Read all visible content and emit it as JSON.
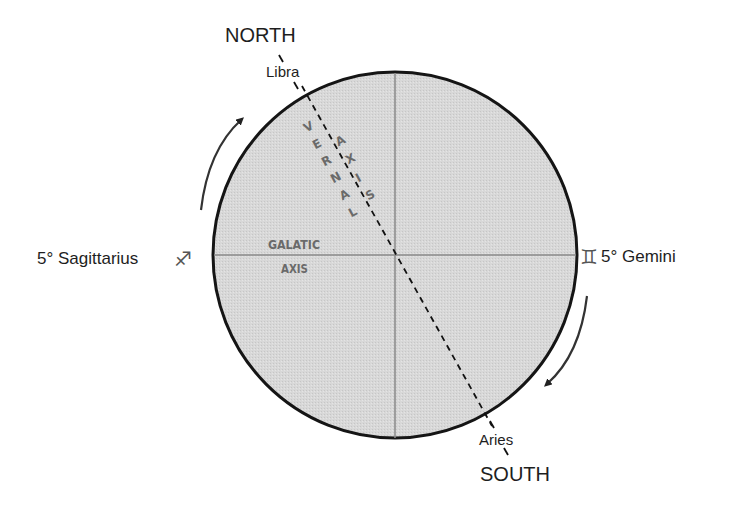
{
  "diagram": {
    "north_label": "NORTH",
    "south_label": "SOUTH",
    "top_point_label": "Libra",
    "bottom_point_label": "Aries",
    "left_label": "5° Sagittarius",
    "right_label": "5° Gemini",
    "left_symbol": "♐",
    "right_symbol": "♊",
    "galactic_axis_line1": "GALATIC",
    "galactic_axis_line2": "AXIS",
    "vernal_letters": [
      "V",
      "E",
      "R",
      "N",
      "A",
      "L"
    ],
    "axis_letters": [
      "A",
      "X",
      "I",
      "S"
    ],
    "colors": {
      "circle_fill": "#d6d6d6",
      "circle_stroke": "#151515",
      "axis_line": "#8a8a8a",
      "arrow": "#333333",
      "text": "#1e1e1e"
    }
  }
}
